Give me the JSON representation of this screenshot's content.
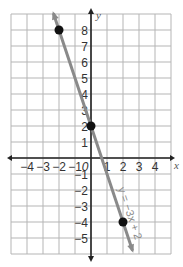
{
  "chart_data": {
    "type": "line",
    "title": "",
    "xlabel": "x",
    "ylabel": "y",
    "xlim": [
      -5,
      5
    ],
    "ylim": [
      -6,
      9
    ],
    "grid": true,
    "x_ticks": [
      "-4",
      "-3",
      "-2",
      "-1",
      "0",
      "1",
      "2",
      "3",
      "4"
    ],
    "y_ticks": [
      "8",
      "7",
      "6",
      "5",
      "4",
      "3",
      "2",
      "1",
      "-1",
      "-2",
      "-3",
      "-4",
      "-5"
    ],
    "series": [
      {
        "name": "y = -3x + 2",
        "equation_label": "y = −3x + 2",
        "slope": -3,
        "intercept": 2,
        "color": "#8a8a8a",
        "points": [
          {
            "x": -2,
            "y": 8
          },
          {
            "x": 0,
            "y": 2
          },
          {
            "x": 2,
            "y": -4
          }
        ]
      }
    ],
    "point_color": "#111111",
    "grid_color": "#b5b5b5",
    "axis_color": "#222222"
  }
}
